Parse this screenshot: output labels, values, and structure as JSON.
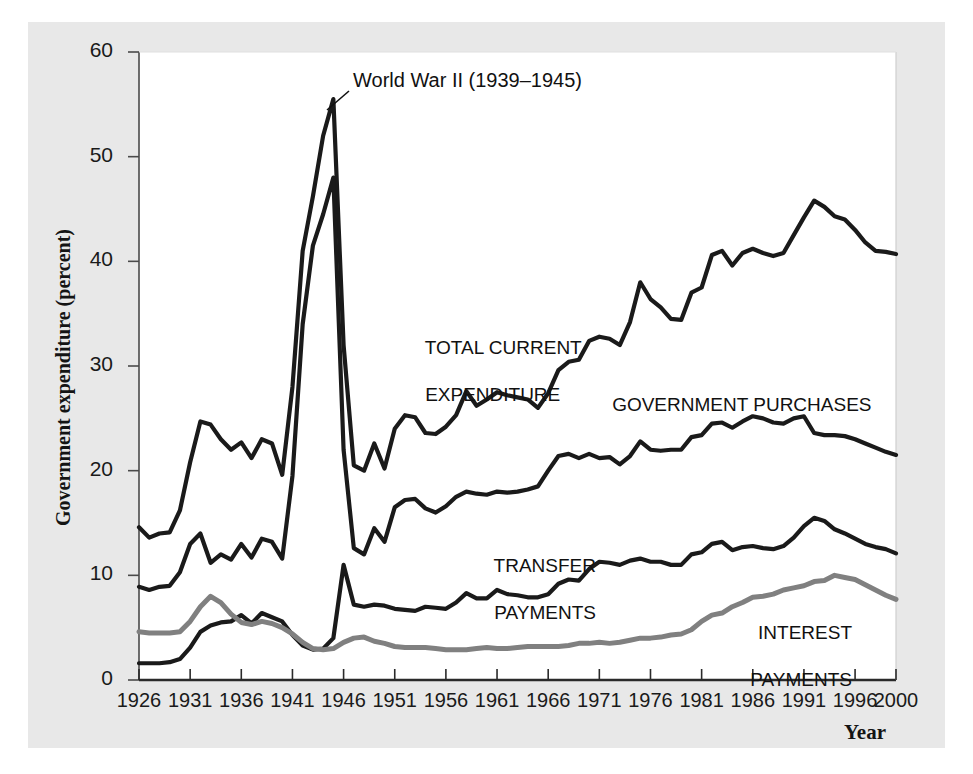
{
  "chart_data": {
    "type": "line",
    "title": "",
    "xlabel": "Year",
    "ylabel": "Government expenditure (percent)",
    "xlim": [
      1926,
      2000
    ],
    "ylim": [
      0,
      60
    ],
    "grid": false,
    "legend_position": "inline-labels",
    "xticks": [
      "1926",
      "1931",
      "1936",
      "1941",
      "1946",
      "1951",
      "1956",
      "1961",
      "1966",
      "1971",
      "1976",
      "1981",
      "1986",
      "1991",
      "1996",
      "2000"
    ],
    "yticks": [
      "0",
      "10",
      "20",
      "30",
      "40",
      "50",
      "60"
    ],
    "annotations": [
      {
        "text": "World War II (1939–1945)",
        "x": 1939,
        "y": 56.5
      }
    ],
    "x": [
      1926,
      1927,
      1928,
      1929,
      1930,
      1931,
      1932,
      1933,
      1934,
      1935,
      1936,
      1937,
      1938,
      1939,
      1940,
      1941,
      1942,
      1943,
      1944,
      1945,
      1946,
      1947,
      1948,
      1949,
      1950,
      1951,
      1952,
      1953,
      1954,
      1955,
      1956,
      1957,
      1958,
      1959,
      1960,
      1961,
      1962,
      1963,
      1964,
      1965,
      1966,
      1967,
      1968,
      1969,
      1970,
      1971,
      1972,
      1973,
      1974,
      1975,
      1976,
      1977,
      1978,
      1979,
      1980,
      1981,
      1982,
      1983,
      1984,
      1985,
      1986,
      1987,
      1988,
      1989,
      1990,
      1991,
      1992,
      1993,
      1994,
      1995,
      1996,
      1997,
      1998,
      1999,
      2000
    ],
    "series": [
      {
        "name": "TOTAL CURRENT EXPENDITURE",
        "color": "#1a1a1a",
        "values": [
          14.6,
          13.6,
          14.0,
          14.1,
          16.2,
          20.8,
          24.7,
          24.4,
          23.0,
          22.0,
          22.7,
          21.2,
          23.0,
          22.6,
          19.6,
          28.0,
          41.0,
          46.2,
          52.0,
          55.5,
          32.0,
          20.5,
          20.0,
          22.6,
          20.2,
          24.0,
          25.3,
          25.1,
          23.6,
          23.5,
          24.2,
          25.3,
          27.6,
          26.2,
          26.8,
          27.5,
          27.2,
          27.0,
          26.8,
          26.0,
          27.4,
          29.6,
          30.4,
          30.6,
          32.4,
          32.8,
          32.6,
          32.0,
          34.2,
          38.0,
          36.4,
          35.6,
          34.5,
          34.4,
          37.0,
          37.5,
          40.6,
          41.0,
          39.6,
          40.8,
          41.2,
          40.8,
          40.5,
          40.8,
          42.5,
          44.2,
          45.8,
          45.2,
          44.3,
          44.0,
          43.0,
          41.8,
          41.0,
          40.9,
          40.7
        ]
      },
      {
        "name": "GOVERNMENT PURCHASES",
        "color": "#1a1a1a",
        "values": [
          8.9,
          8.6,
          8.9,
          9.0,
          10.3,
          13.0,
          14.0,
          11.2,
          12.0,
          11.5,
          13.0,
          11.7,
          13.5,
          13.2,
          11.6,
          19.5,
          34.0,
          41.5,
          44.5,
          48.0,
          22.0,
          12.6,
          12.0,
          14.5,
          13.2,
          16.5,
          17.2,
          17.3,
          16.4,
          16.0,
          16.6,
          17.5,
          18.0,
          17.8,
          17.7,
          18.0,
          17.9,
          18.0,
          18.2,
          18.5,
          20.0,
          21.4,
          21.6,
          21.2,
          21.6,
          21.2,
          21.3,
          20.6,
          21.4,
          22.8,
          22.0,
          21.9,
          22.0,
          22.0,
          23.2,
          23.4,
          24.5,
          24.6,
          24.1,
          24.7,
          25.2,
          25.0,
          24.6,
          24.5,
          25.0,
          25.2,
          23.6,
          23.4,
          23.4,
          23.3,
          23.0,
          22.6,
          22.2,
          21.8,
          21.5
        ]
      },
      {
        "name": "TRANSFER PAYMENTS",
        "color": "#1a1a1a",
        "values": [
          1.6,
          1.6,
          1.6,
          1.7,
          2.0,
          3.1,
          4.6,
          5.2,
          5.5,
          5.6,
          6.2,
          5.4,
          6.4,
          6.0,
          5.6,
          4.3,
          3.3,
          2.9,
          3.0,
          4.0,
          11.0,
          7.2,
          7.0,
          7.2,
          7.1,
          6.8,
          6.7,
          6.6,
          7.0,
          6.9,
          6.8,
          7.4,
          8.3,
          7.8,
          7.8,
          8.6,
          8.2,
          8.1,
          7.9,
          7.9,
          8.2,
          9.2,
          9.6,
          9.5,
          10.6,
          11.3,
          11.2,
          11.0,
          11.4,
          11.6,
          11.3,
          11.3,
          11.0,
          11.0,
          12.0,
          12.2,
          13.0,
          13.2,
          12.4,
          12.7,
          12.8,
          12.6,
          12.5,
          12.8,
          13.6,
          14.7,
          15.5,
          15.2,
          14.4,
          14.0,
          13.5,
          13.0,
          12.7,
          12.5,
          12.1
        ]
      },
      {
        "name": "INTEREST PAYMENTS",
        "color": "#808080",
        "values": [
          4.6,
          4.5,
          4.5,
          4.5,
          4.6,
          5.6,
          7.0,
          8.0,
          7.4,
          6.3,
          5.5,
          5.3,
          5.6,
          5.4,
          5.0,
          4.4,
          3.6,
          3.0,
          2.9,
          3.0,
          3.6,
          4.0,
          4.1,
          3.7,
          3.5,
          3.2,
          3.1,
          3.1,
          3.1,
          3.0,
          2.9,
          2.9,
          2.9,
          3.0,
          3.1,
          3.0,
          3.0,
          3.1,
          3.2,
          3.2,
          3.2,
          3.2,
          3.3,
          3.5,
          3.5,
          3.6,
          3.5,
          3.6,
          3.8,
          4.0,
          4.0,
          4.1,
          4.3,
          4.4,
          4.8,
          5.6,
          6.2,
          6.4,
          7.0,
          7.4,
          7.9,
          8.0,
          8.2,
          8.6,
          8.8,
          9.0,
          9.4,
          9.5,
          10.0,
          9.8,
          9.6,
          9.1,
          8.6,
          8.1,
          7.7
        ]
      }
    ]
  },
  "labels": {
    "total": {
      "line1": "TOTAL CURRENT",
      "line2": "EXPENDITURE"
    },
    "purchases": {
      "line1": "GOVERNMENT PURCHASES"
    },
    "transfer": {
      "line1": "TRANSFER",
      "line2": "PAYMENTS"
    },
    "interest": {
      "line1": "INTEREST",
      "line2": "PAYMENTS"
    }
  },
  "axis": {
    "y_title": "Government expenditure (percent)",
    "x_title": "Year"
  },
  "colors": {
    "line_dark": "#1a1a1a",
    "line_gray": "#808080",
    "figure_background": "#e8e8e8",
    "plot_background": "#ffffff"
  }
}
